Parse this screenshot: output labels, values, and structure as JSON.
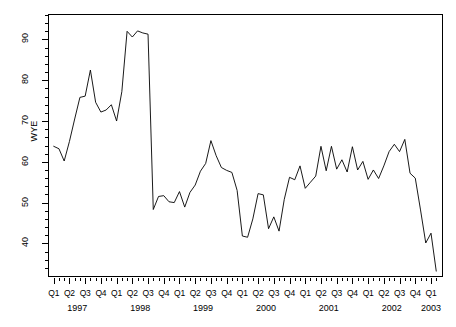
{
  "chart_data": {
    "type": "line",
    "title": "",
    "xlabel": "",
    "ylabel": "WYE",
    "ylim": [
      32,
      96
    ],
    "xlim": [
      "1997-01",
      "2003-02"
    ],
    "grid": false,
    "legend": false,
    "y_ticks_major": [
      40,
      50,
      60,
      70,
      80,
      90
    ],
    "y_tick_step_minor": 2,
    "x_tick_interval": "monthly",
    "x_quarter_labels": [
      "Q1",
      "Q2",
      "Q3",
      "Q4",
      "Q1",
      "Q2",
      "Q3",
      "Q4",
      "Q1",
      "Q2",
      "Q3",
      "Q4",
      "Q1",
      "Q2",
      "Q3",
      "Q4",
      "Q1",
      "Q2",
      "Q3",
      "Q4",
      "Q1",
      "Q2",
      "Q3",
      "Q4",
      "Q1"
    ],
    "x_year_labels": [
      "1997",
      "1998",
      "1999",
      "2000",
      "2001",
      "2002",
      "2003"
    ],
    "line_color": "#000000",
    "series": [
      {
        "name": "WYE",
        "x": [
          "1997-01",
          "1997-02",
          "1997-03",
          "1997-04",
          "1997-05",
          "1997-06",
          "1997-07",
          "1997-08",
          "1997-09",
          "1997-10",
          "1997-11",
          "1997-12",
          "1998-01",
          "1998-02",
          "1998-03",
          "1998-04",
          "1998-05",
          "1998-06",
          "1998-07",
          "1998-08",
          "1998-09",
          "1998-10",
          "1998-11",
          "1998-12",
          "1999-01",
          "1999-02",
          "1999-03",
          "1999-04",
          "1999-05",
          "1999-06",
          "1999-07",
          "1999-08",
          "1999-09",
          "1999-10",
          "1999-11",
          "1999-12",
          "2000-01",
          "2000-02",
          "2000-03",
          "2000-04",
          "2000-05",
          "2000-06",
          "2000-07",
          "2000-08",
          "2000-09",
          "2000-10",
          "2000-11",
          "2000-12",
          "2001-01",
          "2001-02",
          "2001-03",
          "2001-04",
          "2001-05",
          "2001-06",
          "2001-07",
          "2001-08",
          "2001-09",
          "2001-10",
          "2001-11",
          "2001-12",
          "2002-01",
          "2002-02",
          "2002-03",
          "2002-04",
          "2002-05",
          "2002-06",
          "2002-07",
          "2002-08",
          "2002-09",
          "2002-10",
          "2002-11",
          "2002-12",
          "2003-01",
          "2003-02"
        ],
        "values": [
          63.8,
          63.2,
          60.2,
          65.0,
          70.5,
          75.8,
          76.1,
          82.5,
          74.6,
          72.2,
          72.7,
          74.0,
          70.0,
          77.2,
          92.0,
          90.6,
          92.1,
          91.6,
          91.3,
          48.3,
          51.5,
          51.7,
          50.2,
          50.0,
          52.7,
          48.9,
          52.5,
          54.3,
          57.7,
          59.6,
          65.2,
          61.5,
          58.6,
          57.9,
          57.4,
          53.0,
          41.8,
          41.5,
          46.0,
          52.2,
          51.9,
          43.6,
          46.5,
          43.0,
          50.8,
          56.2,
          55.6,
          59.0,
          53.5,
          55.0,
          56.5,
          63.8,
          57.8,
          63.8,
          58.2,
          60.5,
          57.5,
          63.7,
          58.0,
          60.1,
          55.7,
          58.0,
          55.9,
          59.0,
          62.5,
          64.3,
          62.5,
          65.5,
          57.2,
          56.0,
          48.2,
          40.1,
          42.5,
          33.2
        ]
      }
    ]
  }
}
